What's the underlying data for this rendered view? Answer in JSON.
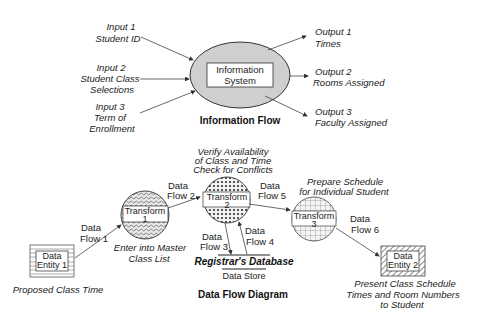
{
  "information_flow": {
    "title": "Information Flow",
    "system": {
      "line1": "Information",
      "line2": "System"
    },
    "inputs": [
      {
        "line1": "Input 1",
        "line2": "Student ID",
        "line3": ""
      },
      {
        "line1": "Input 2",
        "line2": "Student  Class",
        "line3": "Selections"
      },
      {
        "line1": "Input 3",
        "line2": "Term of",
        "line3": "Enrollment"
      }
    ],
    "outputs": [
      {
        "line1": "Output 1",
        "line2": "Times"
      },
      {
        "line1": "Output 2",
        "line2": "Rooms Assigned"
      },
      {
        "line1": "Output 3",
        "line2": "Faculty Assigned"
      }
    ]
  },
  "data_flow_diagram": {
    "title": "Data Flow Diagram",
    "entities": [
      {
        "line1": "Data",
        "line2": "Entity 1",
        "caption": "Proposed Class Time"
      },
      {
        "line1": "Data",
        "line2": "Entity 2",
        "caption_line1": "Present Class Schedule",
        "caption_line2": "Times and Room Numbers",
        "caption_line3": "to Student"
      }
    ],
    "transforms": [
      {
        "name": "Transform",
        "num": "1",
        "caption_line1": "Enter into Master",
        "caption_line2": "Class List"
      },
      {
        "name": "Transform",
        "num": "2",
        "caption_line1": "Verify Availability",
        "caption_line2": "of Class and Time",
        "caption_line3": "Check for Conflicts"
      },
      {
        "name": "Transform",
        "num": "3",
        "caption_line1": "Prepare Schedule",
        "caption_line2": "for Individual Student"
      }
    ],
    "flows": [
      {
        "line1": "Data",
        "line2": "Flow 1"
      },
      {
        "line1": "Data",
        "line2": "Flow 2"
      },
      {
        "line1": "Data",
        "line2": "Flow 3"
      },
      {
        "line1": "Data",
        "line2": "Flow  4"
      },
      {
        "line1": "Data",
        "line2": "Flow 5"
      },
      {
        "line1": "Data",
        "line2": "Flow  6"
      }
    ],
    "data_store": {
      "name": "Registrar's Database",
      "label": "Data Store"
    }
  }
}
